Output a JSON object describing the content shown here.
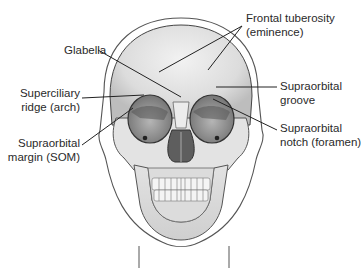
{
  "figure": {
    "labels": [
      {
        "id": "frontal-tuberosity",
        "line1": "Frontal tuberosity",
        "line2": "(eminence)"
      },
      {
        "id": "glabella",
        "line1": "Glabella",
        "line2": ""
      },
      {
        "id": "superciliary-ridge",
        "line1": "Superciliary",
        "line2": "ridge (arch)"
      },
      {
        "id": "supraorbital-groove",
        "line1": "Supraorbital",
        "line2": "groove"
      },
      {
        "id": "supraorbital-margin",
        "line1": "Supraorbital",
        "line2": "margin (SOM)"
      },
      {
        "id": "supraorbital-notch",
        "line1": "Supraorbital",
        "line2": "notch (foramen)"
      }
    ],
    "colors": {
      "bone": "#e6e6e6",
      "bone_shadow": "#c8c8c8",
      "orbit": "#8a8a8a",
      "outline": "#444444",
      "leader": "#222222",
      "text": "#2a2a2a"
    }
  }
}
